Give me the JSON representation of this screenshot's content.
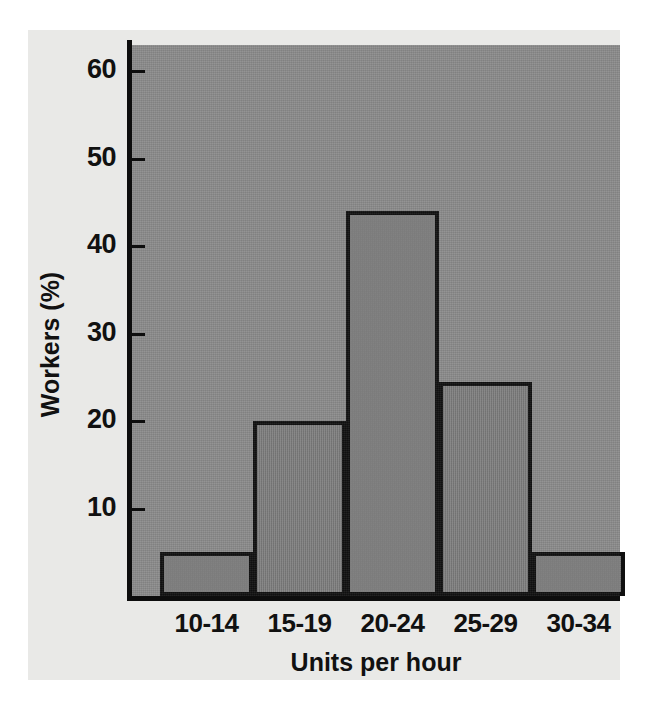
{
  "chart_data": {
    "type": "bar",
    "title": "",
    "subtitle": "",
    "xlabel": "Units per hour",
    "ylabel": "Workers (%)",
    "categories": [
      "10-14",
      "15-19",
      "20-24",
      "25-29",
      "30-34"
    ],
    "values": [
      5,
      20,
      44,
      24.5,
      5
    ],
    "series": [
      {
        "name": "Workers (%)",
        "values": [
          5,
          20,
          44,
          24.5,
          5
        ]
      }
    ],
    "ytick_labels": [
      "10",
      "20",
      "30",
      "40",
      "50",
      "60"
    ],
    "ytick_values": [
      10,
      20,
      30,
      40,
      50,
      60
    ],
    "ylim": [
      0,
      63
    ],
    "xlim_note": "categorical, contiguous histogram bins",
    "grid": false,
    "legend": false,
    "legend_position": "none",
    "annotations": [],
    "colors": {
      "page_background": "#ffffff",
      "paper_background": "#e9e9e7",
      "plot_panel": "#8b8b8b",
      "bar_fill": "#808080",
      "bar_outline": "#101010",
      "axis": "#0d0d0d",
      "text": "#111111"
    }
  },
  "figure": {
    "y_axis_title": "Workers (%)",
    "x_axis_title": "Units per hour"
  }
}
